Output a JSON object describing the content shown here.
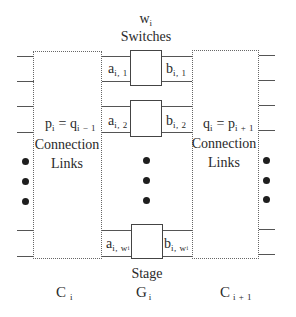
{
  "diagram": {
    "title": {
      "count_var": "w",
      "count_sub": "i",
      "label": "Switches"
    },
    "left_box": {
      "eq_left": "p",
      "eq_left_sub": "i",
      "eq_op": " = ",
      "eq_right": "q",
      "eq_right_sub": "i − 1",
      "line1": "Connection",
      "line2": "Links"
    },
    "right_box": {
      "eq_left": "q",
      "eq_left_sub": "i",
      "eq_op": " = ",
      "eq_right": "p",
      "eq_right_sub": "i + 1",
      "line1": "Connection",
      "line2": "Links"
    },
    "switches": [
      {
        "in_var": "a",
        "in_sub": "i, 1",
        "out_var": "b",
        "out_sub": "i, 1"
      },
      {
        "in_var": "a",
        "in_sub": "i, 2",
        "out_var": "b",
        "out_sub": "i, 2"
      },
      {
        "in_var": "a",
        "in_sub": "i, w",
        "in_subsub": "i",
        "out_var": "b",
        "out_sub": "i, w",
        "out_subsub": "i"
      }
    ],
    "stage_label": "Stage",
    "bottom_labels": {
      "left": {
        "var": "C",
        "sub": "i"
      },
      "middle": {
        "var": "G",
        "sub": "i"
      },
      "right": {
        "var": "C",
        "sub": "i + 1"
      }
    },
    "ellipsis_glyph": "•",
    "colors": {
      "line": "#555555",
      "dotted_border": "#666666",
      "text": "#2a2a2a",
      "dot": "#1e1e1e"
    }
  }
}
